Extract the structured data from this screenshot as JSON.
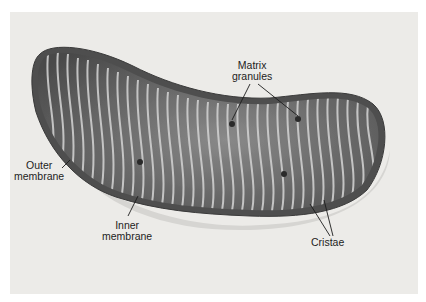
{
  "diagram": {
    "labels": {
      "matrix_granules": {
        "line1": "Matrix",
        "line2": "granules"
      },
      "outer_membrane": {
        "line1": "Outer",
        "line2": "membrane"
      },
      "inner_membrane": {
        "line1": "Inner",
        "line2": "membrane"
      },
      "cristae": {
        "line1": "Cristae"
      }
    },
    "colors": {
      "background": "#ecebe8",
      "outer_shell": "#5a5a5a",
      "interior": "#6e6e6e",
      "cristae": "#c9c9c9",
      "text": "#1c1c1c"
    }
  }
}
